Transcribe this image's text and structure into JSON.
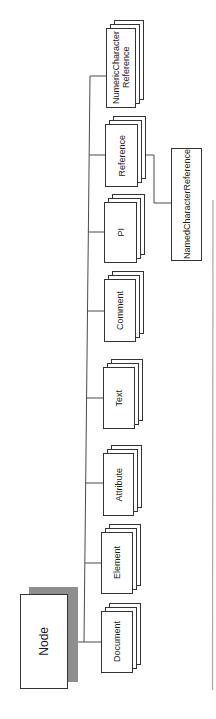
{
  "figure": {
    "root": {
      "label": "Node"
    },
    "children": [
      {
        "label": "Document"
      },
      {
        "label": "Element"
      },
      {
        "label": "Attribute"
      },
      {
        "label": "Text"
      },
      {
        "label": "Comment"
      },
      {
        "label": "PI"
      },
      {
        "label": "Reference",
        "children": [
          {
            "label": "NamedCharacterReference"
          }
        ]
      },
      {
        "label_lines": [
          "NumericCharacter",
          "Reference"
        ]
      }
    ]
  },
  "colors": {
    "line": "#4a4a4a",
    "box_border": "#333333",
    "root_shadow": "#8e8e8e",
    "page_edge": "#a8a8a8"
  }
}
